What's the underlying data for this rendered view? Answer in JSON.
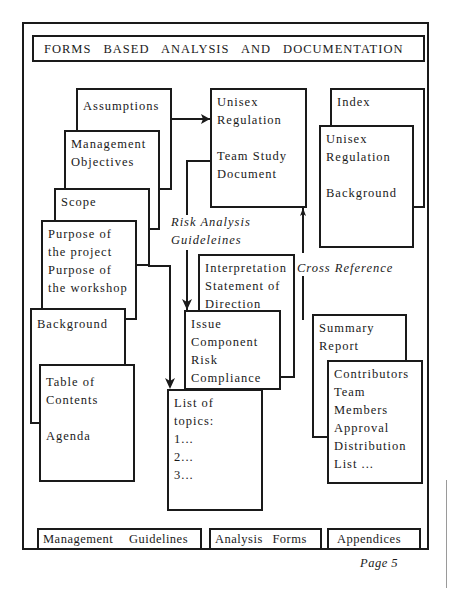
{
  "header": {
    "title": "FORMS BASED ANALYSIS AND DOCUMENTATION"
  },
  "left_stack": {
    "assumptions": {
      "label": "Assumptions"
    },
    "management_objectives": {
      "line1": "Management",
      "line2": "Objectives"
    },
    "scope": {
      "label": "Scope"
    },
    "purpose": {
      "line1": "Purpose of",
      "line2": "the project",
      "line3": "Purpose of",
      "line4": "the workshop"
    },
    "background": {
      "label": "Background"
    },
    "table_of_contents": {
      "line1": "Table of",
      "line2": "Contents",
      "line3": "Agenda"
    }
  },
  "center_stack": {
    "unisex_team_study": {
      "line1": "Unisex",
      "line2": "Regulation",
      "line3": "Team Study",
      "line4": "Document"
    },
    "risk_label": {
      "line1": "Risk Analysis",
      "line2": "Guideleines"
    },
    "interpretation": {
      "line1": "Interpretation",
      "line2": "Statement of",
      "line3": "Direction"
    },
    "issue": {
      "line1": "Issue",
      "line2": "Component",
      "line3": "Risk",
      "line4": "Compliance"
    },
    "list_of_topics": {
      "line1": "List of",
      "line2": "topics:",
      "line3": "1...",
      "line4": "2...",
      "line5": "3..."
    }
  },
  "right_stack": {
    "index": {
      "label": "Index"
    },
    "unisex_background": {
      "line1": "Unisex",
      "line2": "Regulation",
      "line3": "Background"
    },
    "cross_reference_label": "Cross Reference",
    "summary_report": {
      "line1": "Summary",
      "line2": "Report"
    },
    "contributors": {
      "line1": "Contributors",
      "line2": "Team",
      "line3": "Members",
      "line4": "Approval",
      "line5": "Distribution",
      "line6": "List ..."
    }
  },
  "footer": {
    "management_guidelines": "Management  Guidelines",
    "analysis_forms": "Analysis  Forms",
    "appendices": "Appendices",
    "page": "Page 5"
  },
  "colors": {
    "ink": "#1a1a1a",
    "paper": "#ffffff"
  }
}
